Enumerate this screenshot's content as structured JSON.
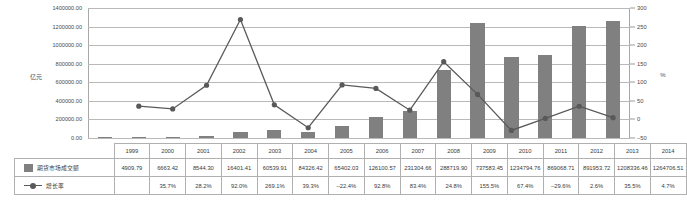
{
  "chart_data": {
    "type": "bar",
    "title": "",
    "subtitle": "",
    "xlabel": "",
    "ylabel": "亿元",
    "ylabel_right": "%",
    "grid": true,
    "legend_position": "table-left",
    "categories": [
      "1999",
      "2000",
      "2001",
      "2002",
      "2003",
      "2004",
      "2005",
      "2006",
      "2007",
      "2008",
      "2009",
      "2010",
      "2011",
      "2012",
      "2013",
      "2014"
    ],
    "ylim": [
      0,
      1400000
    ],
    "yticks": [
      "0.00",
      "200000.00",
      "400000.00",
      "600000.00",
      "800000.00",
      "1000000.00",
      "1200000.00",
      "1400000.00"
    ],
    "ylim_right": [
      -50,
      300
    ],
    "yticks_right": [
      "-50",
      "0",
      "50",
      "100",
      "150",
      "200",
      "250",
      "300"
    ],
    "series": [
      {
        "name": "期货市场成交额",
        "type": "bar",
        "axis": "left",
        "color": "#808080",
        "values": [
          4909.79,
          6663.42,
          8544.3,
          16401.41,
          60539.91,
          84326.42,
          65402.03,
          126100.57,
          231304.66,
          288719.9,
          737583.45,
          1234794.76,
          869068.71,
          891953.72,
          1208336.46,
          1264706.51
        ],
        "display_values": [
          "4909.79",
          "6663.42",
          "8544.30",
          "16401.41",
          "60539.91",
          "84326.42",
          "65402.03",
          "126100.57",
          "231304.66",
          "288719.90",
          "737583.45",
          "1234794.76",
          "869068.71",
          "891953.72",
          "1208336.46",
          "1264706.51"
        ]
      },
      {
        "name": "增长率",
        "type": "line",
        "axis": "right",
        "color": "#595959",
        "values": [
          null,
          35.7,
          28.2,
          92.0,
          269.1,
          39.3,
          -22.4,
          92.8,
          83.4,
          24.8,
          155.5,
          67.4,
          -29.6,
          2.6,
          35.5,
          4.7
        ],
        "display_values": [
          "",
          "35.7%",
          "28.2%",
          "92.0%",
          "269.1%",
          "39.3%",
          "-22.4%",
          "92.8%",
          "83.4%",
          "24.8%",
          "155.5%",
          "67.4%",
          "-29.6%",
          "2.6%",
          "35.5%",
          "4.7%"
        ]
      }
    ]
  },
  "colors": {
    "bar": "#808080",
    "line": "#595959",
    "grid": "#b9b9b9",
    "border": "#b0b0b0",
    "text": "#3a3a3a"
  }
}
